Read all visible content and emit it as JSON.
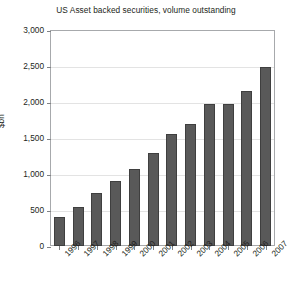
{
  "chart_data": {
    "type": "bar",
    "title": "US Asset backed securities, volume outstanding",
    "xlabel": "",
    "ylabel": "$bn",
    "categories": [
      "1996",
      "1997",
      "1998",
      "1999",
      "2000",
      "2001",
      "2002",
      "2003",
      "2004",
      "2005",
      "2006",
      "2007"
    ],
    "values": [
      400,
      540,
      730,
      900,
      1070,
      1290,
      1550,
      1700,
      1970,
      1970,
      2150,
      2480
    ],
    "ylim": [
      0,
      3000
    ],
    "ytick_values": [
      0,
      500,
      1000,
      1500,
      2000,
      2500,
      3000
    ],
    "ytick_labels": [
      "0",
      "500",
      "1,000",
      "1,500",
      "2,000",
      "2,500",
      "3,000"
    ],
    "grid": true,
    "legend": "none",
    "bar_color": "#595959",
    "bar_border_color": "#3f3f3f",
    "gridline_color": "#e3e3e3",
    "frame_color": "#a7a9ac",
    "text_color": "#231f20",
    "background": "#ffffff"
  }
}
